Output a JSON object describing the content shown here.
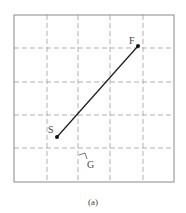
{
  "figure": {
    "caption": "(a)",
    "labels": {
      "start": "S",
      "finish": "F",
      "grid": "G"
    },
    "grid": {
      "columns": 5,
      "rows": 5,
      "line_style": "dashed"
    },
    "colors": {
      "frame": "#8a8a8a",
      "grid": "#a8a8a8",
      "path": "#1a1a1a",
      "text": "#444444"
    }
  }
}
